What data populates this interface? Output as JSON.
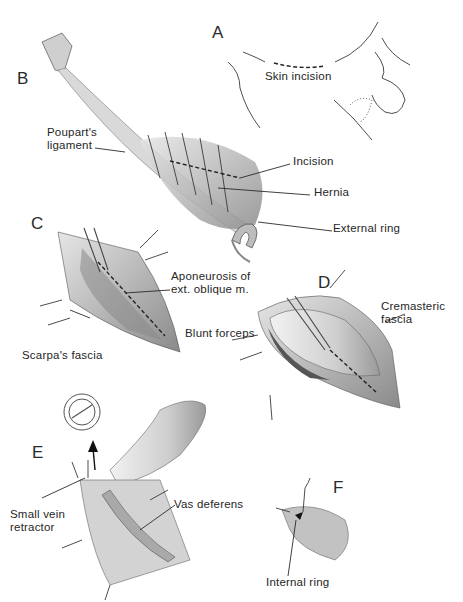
{
  "figure": {
    "panels": [
      {
        "id": "A",
        "labels": [
          "Skin incision"
        ]
      },
      {
        "id": "B",
        "labels": [
          "Poupart's ligament",
          "Incision",
          "Hernia",
          "External ring"
        ]
      },
      {
        "id": "C",
        "labels": [
          "Aponeurosis of",
          "ext. oblique m.",
          "Scarpa's fascia",
          "Blunt forceps"
        ]
      },
      {
        "id": "D",
        "labels": [
          "Cremasteric",
          "fascia"
        ]
      },
      {
        "id": "E",
        "labels": [
          "Small vein",
          "retractor",
          "Vas deferens"
        ]
      },
      {
        "id": "F",
        "labels": [
          "Internal ring"
        ]
      }
    ]
  },
  "labels": {
    "panel_a": "A",
    "panel_b": "B",
    "panel_c": "C",
    "panel_d": "D",
    "panel_e": "E",
    "panel_f": "F",
    "skin_incision": "Skin incision",
    "pouparts_1": "Poupart's",
    "pouparts_2": "ligament",
    "incision": "Incision",
    "hernia": "Hernia",
    "external_ring": "External ring",
    "aponeurosis_1": "Aponeurosis of",
    "aponeurosis_2": "ext. oblique m.",
    "blunt_forceps": "Blunt forceps",
    "scarpas_fascia": "Scarpa's fascia",
    "cremasteric_1": "Cremasteric",
    "cremasteric_2": "fascia",
    "small_vein_1": "Small vein",
    "small_vein_2": "retractor",
    "vas_deferens": "Vas deferens",
    "internal_ring": "Internal ring"
  }
}
